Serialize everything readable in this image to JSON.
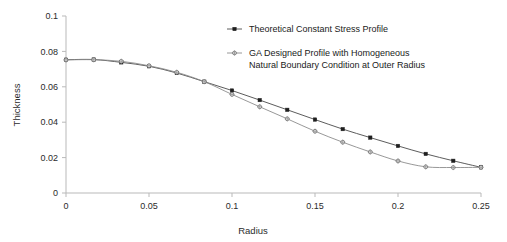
{
  "chart_data": {
    "type": "line",
    "title": "",
    "xlabel": "Radius",
    "ylabel": "Thickness",
    "xlim": [
      0,
      0.25
    ],
    "ylim": [
      0,
      0.1
    ],
    "xticks": [
      "0",
      "0.05",
      "0.1",
      "0.15",
      "0.2",
      "0.25"
    ],
    "xtick_values": [
      0,
      0.05,
      0.1,
      0.15,
      0.2,
      0.25
    ],
    "yticks": [
      "0",
      "0.02",
      "0.04",
      "0.06",
      "0.08",
      "0.1"
    ],
    "ytick_values": [
      0,
      0.02,
      0.04,
      0.06,
      0.08,
      0.1
    ],
    "grid": false,
    "legend_position": "top-right",
    "x": [
      0,
      0.0167,
      0.0333,
      0.05,
      0.0667,
      0.0833,
      0.1,
      0.1167,
      0.1333,
      0.15,
      0.1667,
      0.1833,
      0.2,
      0.2167,
      0.2333,
      0.25
    ],
    "series": [
      {
        "name": "Theoretical Constant Stress Profile",
        "marker": "filled-square",
        "color": "#1f1f1f",
        "values": [
          0.0753,
          0.0754,
          0.0738,
          0.0716,
          0.0678,
          0.0629,
          0.0579,
          0.0525,
          0.047,
          0.0415,
          0.0361,
          0.0313,
          0.0266,
          0.0221,
          0.0182,
          0.0145
        ]
      },
      {
        "name": "GA Designed Profile with Homogeneous Natural Boundary Condition at Outer Radius",
        "marker": "open-star",
        "color": "#8c8c8c",
        "values": [
          0.0752,
          0.0753,
          0.0744,
          0.0719,
          0.0682,
          0.0629,
          0.0557,
          0.0487,
          0.0419,
          0.0349,
          0.0287,
          0.0232,
          0.0181,
          0.0148,
          0.0144,
          0.0145
        ]
      }
    ]
  },
  "legend": {
    "entries": [
      {
        "label": "Theoretical Constant Stress Profile",
        "lines": [
          "Theoretical Constant Stress Profile"
        ]
      },
      {
        "label": "GA Designed Profile with Homogeneous Natural Boundary Condition at Outer Radius",
        "lines": [
          "GA Designed Profile with Homogeneous",
          "Natural Boundary Condition at Outer Radius"
        ]
      }
    ]
  },
  "axes": {
    "x_title": "Radius",
    "y_title": "Thickness"
  }
}
